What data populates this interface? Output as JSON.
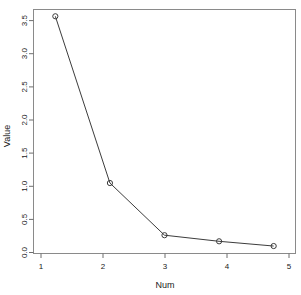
{
  "chart_data": {
    "type": "line",
    "title": "",
    "subtitle": "",
    "xlabel": "Num",
    "ylabel": "Value",
    "x": [
      1,
      2,
      3,
      4,
      5
    ],
    "values": [
      3.5,
      1.04,
      0.27,
      0.18,
      0.11
    ],
    "categories": [
      "1",
      "2",
      "3",
      "4",
      "5"
    ],
    "xtick_labels": [
      "1",
      "2",
      "3",
      "4",
      "5"
    ],
    "ytick_labels": [
      "0.0",
      "0.5",
      "1.0",
      "1.5",
      "2.0",
      "2.5",
      "3.0",
      "3.5"
    ],
    "ytick_values": [
      0.0,
      0.5,
      1.0,
      1.5,
      2.0,
      2.5,
      3.0,
      3.5
    ],
    "xlim": [
      0.6,
      5.4
    ],
    "ylim": [
      0.0,
      3.6
    ],
    "grid": false,
    "legend": false,
    "legend_position": "none",
    "marker": "open-circle",
    "line_color": "#3c3c3c",
    "marker_color": "#3c3c3c",
    "frame_color": "#8a8a8a",
    "background_color": "#ffffff"
  }
}
